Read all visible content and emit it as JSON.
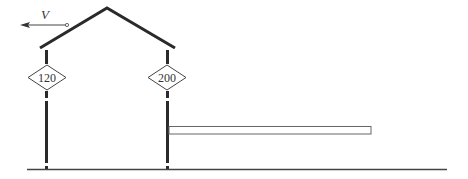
{
  "diagram": {
    "type": "structural frame with velocity",
    "velocity": {
      "label": "V",
      "direction": "left"
    },
    "columns": [
      {
        "id": "left",
        "label": "120"
      },
      {
        "id": "right",
        "label": "200"
      }
    ],
    "colors": {
      "frame": "#2a2a2a",
      "beam": "#555555",
      "ground": "#444444"
    }
  }
}
